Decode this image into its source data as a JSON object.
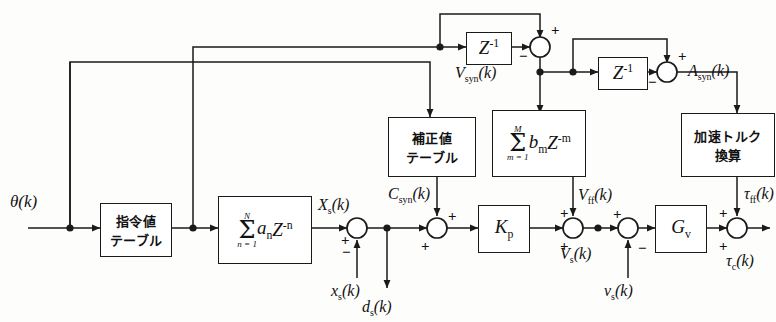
{
  "diagram": {
    "language": "ja",
    "stroke_color": "#1a1a1a",
    "background": "#fdfdfc"
  },
  "blocks": {
    "command_table": {
      "line1": "指令値",
      "line2": "テーブル"
    },
    "fir_a": {
      "sum_upper": "N",
      "sum_lower": "n = 1",
      "term": "a",
      "term_sub": "n",
      "z": "Z",
      "z_exp": "-n"
    },
    "correction_table": {
      "line1": "補正値",
      "line2": "テーブル"
    },
    "fir_b": {
      "sum_upper": "M",
      "sum_lower": "m = 1",
      "term": "b",
      "term_sub": "m",
      "z": "Z",
      "z_exp": "-m"
    },
    "accel_torque": {
      "line1": "加速トルク",
      "line2": "換算"
    },
    "delay_left": {
      "label": "Z",
      "exp": "-1"
    },
    "delay_right": {
      "label": "Z",
      "exp": "-1"
    },
    "kp": {
      "label": "K",
      "sub": "p"
    },
    "gv": {
      "label": "G",
      "sub": "v"
    }
  },
  "signals": {
    "theta": {
      "base": "θ",
      "arg": "(k)"
    },
    "xs_out": {
      "base": "X",
      "sub": "s",
      "arg": "(k)"
    },
    "csyn": {
      "base": "C",
      "sub": "syn",
      "arg": "(k)"
    },
    "vsyn": {
      "base": "V",
      "sub": "syn",
      "arg": "(k)"
    },
    "asyn": {
      "base": "A",
      "sub": "syn",
      "arg": "(k)"
    },
    "vff": {
      "base": "V",
      "sub": "ff",
      "arg": "(k)"
    },
    "vs": {
      "base": "V",
      "sub": "s",
      "arg": "(k)"
    },
    "tff": {
      "base": "τ",
      "sub": "ff",
      "arg": "(k)"
    },
    "tc": {
      "base": "τ",
      "sub": "c",
      "arg": "(k)"
    },
    "xs_fb": {
      "base": "x",
      "sub": "s",
      "arg": "(k)"
    },
    "ds_out": {
      "base": "d",
      "sub": "s",
      "arg": "(k)"
    },
    "vs_fb": {
      "base": "v",
      "sub": "s",
      "arg": "(k)"
    }
  },
  "signs": {
    "plus": "+",
    "minus": "−"
  },
  "sign_markers": [
    {
      "id": "sum-xs-plus",
      "text": "+"
    },
    {
      "id": "sum-xs-minus",
      "text": "−"
    },
    {
      "id": "sum-csyn-plus-top",
      "text": "+"
    },
    {
      "id": "sum-csyn-plus-left",
      "text": "+"
    },
    {
      "id": "sum-vff-plus-top",
      "text": "+"
    },
    {
      "id": "sum-vff-plus-bot",
      "text": "+"
    },
    {
      "id": "sum-vs-plus",
      "text": "+"
    },
    {
      "id": "sum-vs-minus",
      "text": "−"
    },
    {
      "id": "sum-tff-plus-top",
      "text": "+"
    },
    {
      "id": "sum-tff-plus-bot",
      "text": "+"
    },
    {
      "id": "sum-vsyn-plus",
      "text": "+"
    },
    {
      "id": "sum-vsyn-minus",
      "text": "−"
    },
    {
      "id": "sum-asyn-plus",
      "text": "+"
    },
    {
      "id": "sum-asyn-minus",
      "text": "−"
    }
  ]
}
